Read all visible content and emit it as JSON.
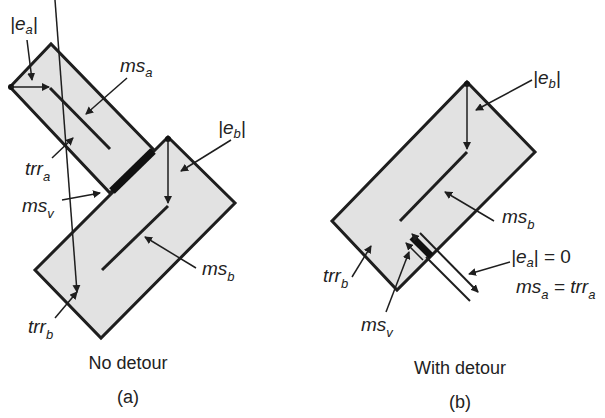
{
  "panels": [
    {
      "id": "a",
      "caption": "No detour",
      "tag": "(a)",
      "labels": {
        "ea": {
          "base": "|e",
          "sub": "a",
          "tail": "|"
        },
        "msa": {
          "base": "ms",
          "sub": "a"
        },
        "trra": {
          "base": "trr",
          "sub": "a"
        },
        "msv": {
          "base": "ms",
          "sub": "v"
        },
        "eb": {
          "base": "|e",
          "sub": "b",
          "tail": "|"
        },
        "msb": {
          "base": "ms",
          "sub": "b"
        },
        "trrb": {
          "base": "trr",
          "sub": "b"
        }
      }
    },
    {
      "id": "b",
      "caption": "With detour",
      "tag": "(b)",
      "labels": {
        "eb": {
          "base": "|e",
          "sub": "b",
          "tail": "|"
        },
        "msb": {
          "base": "ms",
          "sub": "b"
        },
        "trrb": {
          "base": "trr",
          "sub": "b"
        },
        "msv": {
          "base": "ms",
          "sub": "v"
        },
        "ea_eq": {
          "base": "|e",
          "sub": "a",
          "tail": "| = 0"
        },
        "msa_eq": {
          "base": "ms",
          "sub": "a",
          "mid": " = trr",
          "sub2": "a"
        }
      }
    }
  ],
  "colors": {
    "fill": "#e2e2e2",
    "stroke": "#1e1e1e",
    "text": "#222222"
  }
}
